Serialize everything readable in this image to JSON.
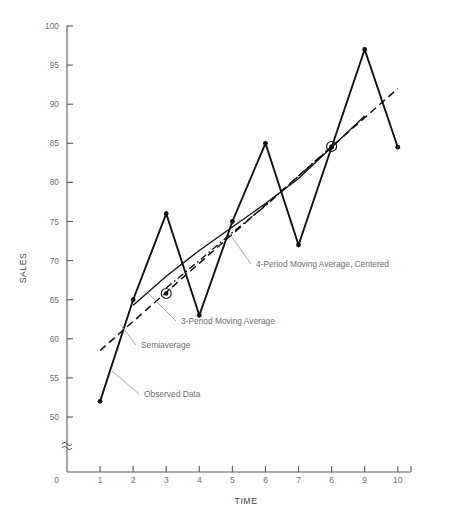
{
  "chart_data": {
    "type": "line",
    "title": "",
    "xlabel": "TIME",
    "ylabel": "SALES",
    "x": [
      1,
      2,
      3,
      4,
      5,
      6,
      7,
      8,
      9,
      10
    ],
    "xticklabels": [
      "1",
      "2",
      "3",
      "4",
      "5",
      "6",
      "7",
      "8",
      "9",
      "10"
    ],
    "xlim": [
      0,
      10.4
    ],
    "ylim": [
      48,
      100
    ],
    "yticks": [
      50,
      55,
      60,
      65,
      70,
      75,
      80,
      85,
      90,
      95,
      100
    ],
    "yticklabels": [
      "50",
      "55",
      "60",
      "65",
      "70",
      "75",
      "80",
      "85",
      "90",
      "95",
      "100"
    ],
    "y_origin_label": "0",
    "y_axis_break": true,
    "grid": false,
    "legend_position": "inline-annotations",
    "series": [
      {
        "name": "Observed Data",
        "style": "solid-with-markers",
        "x": [
          1,
          2,
          3,
          4,
          5,
          6,
          7,
          8,
          9,
          10
        ],
        "values": [
          52,
          65,
          76,
          63,
          75,
          85,
          72,
          84.5,
          97,
          84.5
        ]
      },
      {
        "name": "3-Period Moving Average",
        "style": "solid-thin",
        "x": [
          2,
          3,
          4,
          5,
          6,
          7,
          8,
          9
        ],
        "values": [
          64.3,
          68.0,
          71.3,
          74.3,
          77.3,
          80.5,
          84.5,
          88.5
        ]
      },
      {
        "name": "4-Period Moving Average, Centered",
        "style": "dash-dot",
        "x": [
          3,
          4,
          5,
          6,
          7,
          8
        ],
        "values": [
          66.5,
          70.0,
          73.6,
          77.0,
          80.8,
          84.6
        ]
      },
      {
        "name": "Semiaverage",
        "style": "dashed",
        "x": [
          1,
          10
        ],
        "values": [
          58.5,
          92.0
        ]
      }
    ],
    "markers": [
      {
        "name": "semiaverage-midpoint-left",
        "x": 3,
        "y": 65.8,
        "shape": "circled-dot"
      },
      {
        "name": "semiaverage-midpoint-right",
        "x": 8,
        "y": 84.6,
        "shape": "circled-dot"
      }
    ],
    "annotations": [
      {
        "name": "annotation-ma4",
        "label": "4-Period Moving Average, Centered",
        "text_x": 256,
        "text_y": 267,
        "leader_to_x": 229,
        "leader_to_y": 233
      },
      {
        "name": "annotation-ma3",
        "label": "3-Period Moving Average",
        "text_x": 181,
        "text_y": 324,
        "leader_to_x": 148,
        "leader_to_y": 293
      },
      {
        "name": "annotation-semiaverage",
        "label": "Semiaverage",
        "text_x": 141,
        "text_y": 348,
        "leader_to_x": 120,
        "leader_to_y": 324
      },
      {
        "name": "annotation-observed",
        "label": "Observed Data",
        "text_x": 144,
        "text_y": 397,
        "leader_to_x": 112,
        "leader_to_y": 371
      }
    ],
    "colors": {
      "series": "#111111",
      "axis": "#58585a",
      "ticklabel": "#6d6e71",
      "annotation": "#6d6e71",
      "leader": "#9a9a9d",
      "background": "#ffffff"
    }
  }
}
